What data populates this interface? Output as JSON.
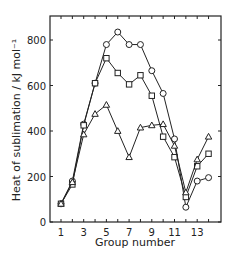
{
  "chart_data": {
    "type": "line",
    "title": "",
    "xlabel": "Group number",
    "ylabel": "Heat of sublimation / kJ mol⁻¹",
    "x": [
      1,
      2,
      3,
      4,
      5,
      6,
      7,
      8,
      9,
      10,
      11,
      12,
      13,
      14
    ],
    "xticks": [
      1,
      3,
      5,
      7,
      9,
      11,
      13
    ],
    "yticks": [
      0,
      200,
      400,
      600,
      800
    ],
    "xlim": [
      0.2,
      14.9
    ],
    "ylim": [
      0,
      900
    ],
    "grid": false,
    "legend": "none",
    "series": [
      {
        "name": "circles",
        "marker": "circle",
        "values": [
          80,
          180,
          430,
          610,
          780,
          835,
          780,
          780,
          665,
          565,
          365,
          65,
          180,
          195
        ]
      },
      {
        "name": "squares",
        "marker": "square",
        "values": [
          80,
          165,
          425,
          610,
          720,
          655,
          605,
          645,
          555,
          375,
          285,
          110,
          245,
          300
        ]
      },
      {
        "name": "triangles",
        "marker": "triangle",
        "values": [
          80,
          175,
          385,
          475,
          515,
          400,
          285,
          415,
          425,
          430,
          335,
          130,
          275,
          375
        ]
      }
    ]
  }
}
